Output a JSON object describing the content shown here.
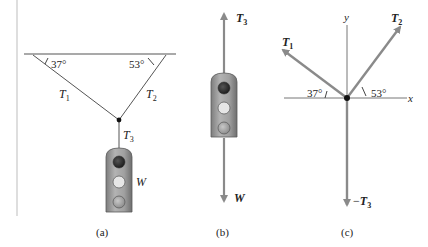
{
  "figure": {
    "colors": {
      "line": "#333333",
      "vector": "#8a8a8a",
      "light_body": "#9a9a9a",
      "light_top": "#2f2f2f",
      "light_mid": "#e6e6e6",
      "light_bottom": "#b5b5b5"
    },
    "panel_a": {
      "caption": "(a)",
      "angle_left": "37°",
      "angle_right": "53°",
      "tension_1": {
        "symbol": "T",
        "sub": "1"
      },
      "tension_2": {
        "symbol": "T",
        "sub": "2"
      },
      "tension_3": {
        "symbol": "T",
        "sub": "3"
      },
      "weight": "W"
    },
    "panel_b": {
      "caption": "(b)",
      "tension_3": {
        "symbol": "T",
        "sub": "3"
      },
      "weight": "W"
    },
    "panel_c": {
      "caption": "(c)",
      "axis_x": "x",
      "axis_y": "y",
      "tension_1": {
        "symbol": "T",
        "sub": "1"
      },
      "tension_2": {
        "symbol": "T",
        "sub": "2"
      },
      "neg_tension_3": {
        "prefix": "−",
        "symbol": "T",
        "sub": "3"
      },
      "angle_left": "37°",
      "angle_right": "53°"
    }
  }
}
